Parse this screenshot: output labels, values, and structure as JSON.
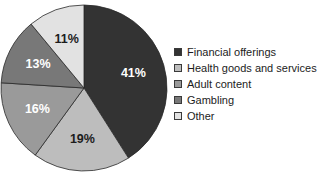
{
  "chart_data": {
    "type": "pie",
    "title": "",
    "subtitle": "",
    "xlabel": "",
    "ylabel": "",
    "grid": false,
    "legend_position": "right",
    "start_angle_deg": 0,
    "direction": "clockwise",
    "categories": [
      "Financial offerings",
      "Health goods and services",
      "Adult content",
      "Gambling",
      "Other"
    ],
    "values": [
      41,
      19,
      16,
      13,
      11
    ],
    "value_unit": "%",
    "data_labels": [
      "41%",
      "19%",
      "16%",
      "13%",
      "11%"
    ],
    "colors": [
      "#333333",
      "#bdbdbd",
      "#9a9a9a",
      "#787878",
      "#e2e2e2"
    ],
    "label_text_colors": [
      "#ffffff",
      "#1c1c1c",
      "#ffffff",
      "#ffffff",
      "#1c1c1c"
    ],
    "slices": [
      {
        "label": "Financial offerings",
        "value": 41,
        "data_label": "41%",
        "color": "#333333",
        "label_color": "#ffffff"
      },
      {
        "label": "Health goods and services",
        "value": 19,
        "data_label": "19%",
        "color": "#bdbdbd",
        "label_color": "#1c1c1c"
      },
      {
        "label": "Adult content",
        "value": 16,
        "data_label": "16%",
        "color": "#9a9a9a",
        "label_color": "#ffffff"
      },
      {
        "label": "Gambling",
        "value": 13,
        "data_label": "13%",
        "color": "#787878",
        "label_color": "#ffffff"
      },
      {
        "label": "Other",
        "value": 11,
        "data_label": "11%",
        "color": "#e2e2e2",
        "label_color": "#1c1c1c"
      }
    ],
    "geometry": {
      "center_x": 84,
      "center_y": 88,
      "radius": 83,
      "slice_edge_color": "#2a2a2a",
      "slice_edge_width": 0.8
    }
  },
  "legend": {
    "items": [
      {
        "label": "Financial offerings"
      },
      {
        "label": "Health goods and services"
      },
      {
        "label": "Adult content"
      },
      {
        "label": "Gambling"
      },
      {
        "label": "Other"
      }
    ]
  },
  "background_color": "#ffffff"
}
